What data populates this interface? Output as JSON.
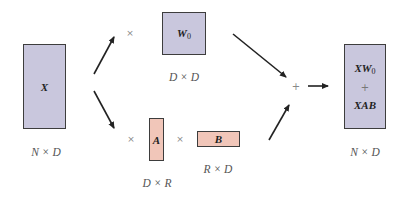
{
  "diagram": {
    "type": "lora-decomposition",
    "colors": {
      "base_matrix_fill": "#c9c7dd",
      "adapter_matrix_fill": "#f1c6b9",
      "border": "#3d3d3d",
      "arrow": "#222222",
      "label_text": "#555555"
    },
    "nodes": {
      "x": {
        "symbol": "X",
        "dims": "N × D"
      },
      "w0": {
        "symbol": "W",
        "subscript": "0",
        "dims": "D × D"
      },
      "a": {
        "symbol": "A",
        "dims": "D × R"
      },
      "b": {
        "symbol": "B",
        "dims": "R × D"
      },
      "result": {
        "line1_symbol": "XW",
        "line1_subscript": "0",
        "plus": "+",
        "line2": "XAB",
        "dims": "N × D"
      }
    },
    "operators": {
      "times_w0": "×",
      "times_a": "×",
      "times_b": "×",
      "add": "+"
    },
    "edges": [
      {
        "from": "x",
        "to": "w0-branch"
      },
      {
        "from": "x",
        "to": "ab-branch"
      },
      {
        "from": "w0",
        "to": "add"
      },
      {
        "from": "b",
        "to": "add"
      },
      {
        "from": "add",
        "to": "result"
      }
    ]
  }
}
